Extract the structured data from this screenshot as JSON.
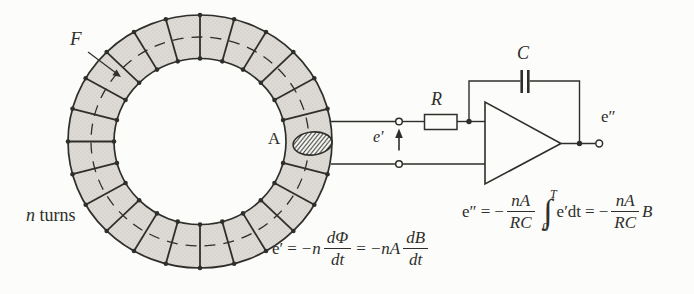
{
  "colors": {
    "background": "#fcfcfa",
    "line": "#2e2e2a",
    "coil_fill": "#dedad6"
  },
  "coil": {
    "flux_label": "F",
    "turns_var": "n",
    "turns_word": "turns",
    "area_label": "A"
  },
  "circuit": {
    "resistor_label": "R",
    "capacitor_label": "C",
    "input_voltage_label": "e′",
    "output_voltage_label": "e″"
  },
  "formulas": {
    "emf": {
      "lhs": "e′",
      "eq1": "=",
      "coef1": "−n",
      "frac1_num": "dΦ",
      "frac1_den": "dt",
      "eq2": "=",
      "coef2": "−nA",
      "frac2_num": "dB",
      "frac2_den": "dt"
    },
    "out": {
      "lhs": "e″",
      "eq1": "=",
      "minus1": "−",
      "frac1_num": "nA",
      "frac1_den": "RC",
      "int_sign": "∫",
      "int_upper": "T",
      "int_lower": "0",
      "integrand": "e′dt",
      "eq2": "=",
      "minus2": "−",
      "frac2_num": "nA",
      "frac2_den": "RC",
      "tail": "B"
    }
  }
}
